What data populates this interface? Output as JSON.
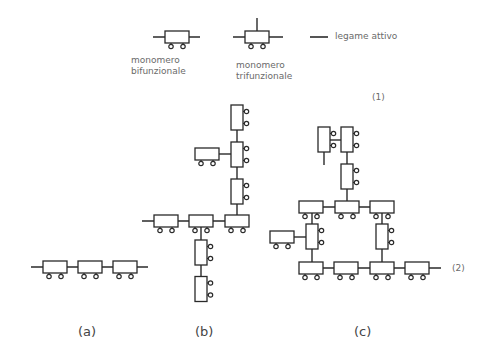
{
  "diagram": {
    "legend": {
      "bifunctional": {
        "line1": "monomero",
        "line2": "bifunzionale"
      },
      "trifunctional": {
        "line1": "monomero",
        "line2": "trifunzionale"
      },
      "active_bond": "legame attivo"
    },
    "equation_marks": {
      "mark1": "(1)",
      "mark2": "(2)"
    },
    "panels": [
      {
        "id": "a",
        "label": "(a)",
        "description": "linear chain of 3 bifunctional monomers"
      },
      {
        "id": "b",
        "label": "(b)",
        "description": "branched polymer with trifunctional monomers"
      },
      {
        "id": "c",
        "label": "(c)",
        "description": "crosslinked network with trifunctional monomers"
      }
    ],
    "colors": {
      "stroke": "#2a2a2a",
      "text": "#6a6a6a"
    }
  }
}
